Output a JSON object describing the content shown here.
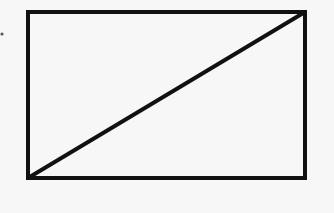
{
  "diagram": {
    "type": "rectangle-with-diagonal",
    "background": "#f7f7f7",
    "stroke_color": "#111111",
    "stroke_width": 4,
    "rectangle": {
      "x": 28,
      "y": 12,
      "width": 277,
      "height": 166
    },
    "diagonal": {
      "x1": 28,
      "y1": 178,
      "x2": 305,
      "y2": 12
    },
    "dot": {
      "cx": 2,
      "cy": 34,
      "r": 1.6,
      "color": "#555555"
    }
  }
}
